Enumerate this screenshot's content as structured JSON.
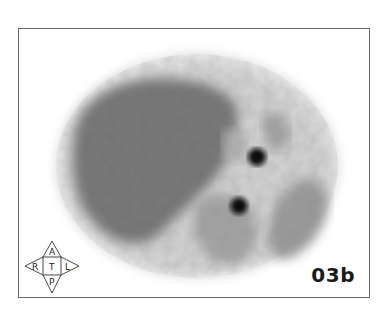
{
  "figure": {
    "label": "03b",
    "orientation": {
      "anterior": "A",
      "right": "R",
      "center": "T",
      "left": "L",
      "posterior": "P"
    },
    "colors": {
      "frame": "#6a6a6a",
      "hotspot": "#0a0a0a",
      "tissue_dark": "#6e6e6e",
      "tissue_light": "#c8c8c8"
    }
  }
}
